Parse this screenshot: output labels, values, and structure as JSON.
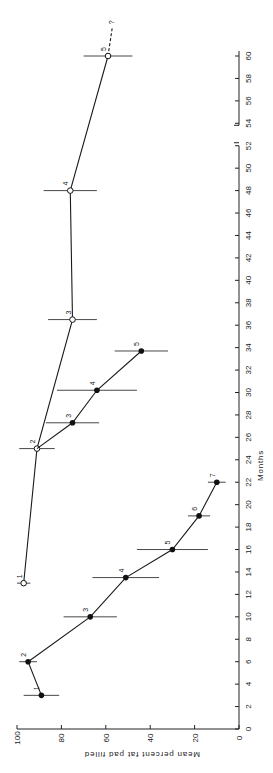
{
  "chart_data": {
    "type": "line",
    "orientation": "rotated-90-clockwise",
    "title": "",
    "xlabel": "Months",
    "ylabel": "Mean percent fat pad filled",
    "xlim": [
      0,
      60
    ],
    "ylim": [
      0,
      100
    ],
    "x_ticks": [
      0,
      2,
      4,
      6,
      8,
      10,
      12,
      14,
      16,
      18,
      20,
      22,
      24,
      26,
      28,
      30,
      32,
      34,
      36,
      38,
      40,
      42,
      44,
      46,
      48,
      50,
      52,
      54,
      56,
      58,
      60
    ],
    "y_ticks": [
      0,
      20,
      40,
      60,
      80,
      100
    ],
    "x_axis_break_between": [
      52,
      54
    ],
    "grid": false,
    "legend": "none",
    "series": [
      {
        "name": "open-circles",
        "marker": "open-circle",
        "points": [
          {
            "label": "1",
            "x": 13,
            "y": 97,
            "err": 3
          },
          {
            "label": "2",
            "x": 25,
            "y": 91,
            "err": 8
          },
          {
            "label": "3",
            "x": 36.5,
            "y": 75,
            "err": 11
          },
          {
            "label": "4",
            "x": 48,
            "y": 76,
            "err": 12
          },
          {
            "label": "5",
            "x": 60,
            "y": 59,
            "err": 11
          }
        ],
        "extension": {
          "label": "?",
          "to_x": 63,
          "to_y": 57,
          "style": "dashed"
        }
      },
      {
        "name": "filled-circles-early",
        "marker": "filled-circle",
        "points": [
          {
            "label": "1",
            "x": 3,
            "y": 89,
            "err": 8
          },
          {
            "label": "2",
            "x": 6,
            "y": 95,
            "err": 4
          },
          {
            "label": "3",
            "x": 10,
            "y": 67,
            "err": 12
          },
          {
            "label": "4",
            "x": 13.5,
            "y": 51,
            "err": 15
          },
          {
            "label": "5",
            "x": 16,
            "y": 30,
            "err": 16
          },
          {
            "label": "6",
            "x": 19,
            "y": 18,
            "err": 5
          },
          {
            "label": "7",
            "x": 22,
            "y": 10,
            "err": 4
          }
        ]
      },
      {
        "name": "filled-circles-late",
        "marker": "filled-circle",
        "start": {
          "x": 25,
          "y": 91
        },
        "points": [
          {
            "label": "3",
            "x": 27.3,
            "y": 75,
            "err": 12
          },
          {
            "label": "4",
            "x": 30.2,
            "y": 64,
            "err": 18
          },
          {
            "label": "5",
            "x": 33.7,
            "y": 44,
            "err": 12
          }
        ]
      }
    ]
  }
}
